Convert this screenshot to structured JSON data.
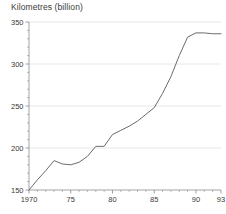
{
  "chart_data": {
    "type": "line",
    "title": "Kilometres (billion)",
    "xlabel": "",
    "ylabel": "",
    "ylim": [
      150,
      350
    ],
    "xlim": [
      1970,
      1993
    ],
    "grid": true,
    "grid_axis": "y",
    "legend": "none",
    "y_ticks": [
      150,
      200,
      250,
      300,
      350
    ],
    "y_tick_labels": [
      "150",
      "200",
      "250",
      "300",
      "350"
    ],
    "y_minor_tick_step": 10,
    "x_ticks": [
      1970,
      1975,
      1980,
      1985,
      1990,
      1993
    ],
    "x_tick_labels": [
      "1970",
      "75",
      "80",
      "85",
      "90",
      "93"
    ],
    "x_minor_tick_step": 1,
    "series": [
      {
        "name": "Kilometres (billion)",
        "color": "#6b6b6b",
        "x": [
          1970,
          1971,
          1972,
          1973,
          1974,
          1975,
          1976,
          1977,
          1978,
          1979,
          1980,
          1981,
          1982,
          1983,
          1984,
          1985,
          1986,
          1987,
          1988,
          1989,
          1990,
          1991,
          1992,
          1993
        ],
        "values": [
          150,
          162,
          173,
          185,
          181,
          180,
          183,
          190,
          202,
          202,
          216,
          221,
          226,
          232,
          240,
          248,
          265,
          285,
          310,
          332,
          337,
          337,
          336,
          336
        ]
      }
    ]
  }
}
